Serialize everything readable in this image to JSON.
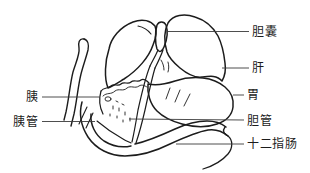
{
  "figure": {
    "ink_color": "#1c1c1c",
    "leader_color": "#3a3a3a",
    "background": "#ffffff",
    "labels": {
      "gallbladder": "胆囊",
      "liver": "肝",
      "stomach": "胃",
      "bile_duct": "胆管",
      "duodenum": "十二指肠",
      "pancreas": "胰",
      "pancreatic_duct": "胰管"
    }
  }
}
